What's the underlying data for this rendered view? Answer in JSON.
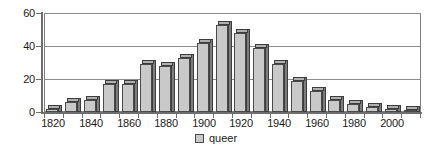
{
  "chart_data": {
    "type": "bar",
    "title": "",
    "xlabel": "",
    "ylabel": "",
    "ylim": [
      0,
      60
    ],
    "yticks": [
      0,
      20,
      40,
      60
    ],
    "grid": true,
    "legend_position": "bottom-center",
    "series_name": "queer",
    "bar_color": "#c9c9c9",
    "bar_edge_color": "#4a4a4a",
    "bar_side_color": "#7d7d7d",
    "grid_color": "#8c8c8c",
    "axis_color": "#6e6e6e",
    "text_color": "#1a1a1a",
    "categories": [
      "1820",
      "1830",
      "1840",
      "1850",
      "1860",
      "1870",
      "1880",
      "1890",
      "1900",
      "1910",
      "1920",
      "1930",
      "1940",
      "1950",
      "1960",
      "1970",
      "1980",
      "1990",
      "2000",
      "2010"
    ],
    "xtick_labels": [
      "1820",
      "1840",
      "1860",
      "1880",
      "1900",
      "1920",
      "1940",
      "1960",
      "1980",
      "2000"
    ],
    "values": [
      2,
      6,
      7,
      17,
      17,
      29,
      28,
      33,
      42,
      53,
      48,
      39,
      29,
      19,
      13,
      7,
      5,
      3,
      2,
      1
    ]
  },
  "legend": {
    "label": "queer"
  }
}
